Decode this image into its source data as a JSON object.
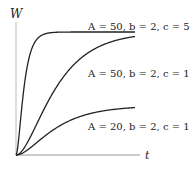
{
  "chart_data": {
    "type": "line",
    "title": "",
    "xlabel": "t",
    "ylabel": "W",
    "formula": "W = A(1 - e^{-ct})^b",
    "xlim": [
      0,
      4
    ],
    "ylim": [
      0,
      54
    ],
    "grid": false,
    "legend": "inline annotations",
    "series": [
      {
        "name": "A = 50, b = 2, c = 5",
        "A": 50,
        "b": 2,
        "c": 5,
        "x": [
          0,
          0.2,
          0.4,
          0.6,
          0.8,
          1.0,
          1.5,
          2,
          3,
          4
        ],
        "values": [
          0,
          20.0,
          37.4,
          45.5,
          48.2,
          49.3,
          50,
          50,
          50,
          50
        ]
      },
      {
        "name": "A = 50, b = 2, c = 1",
        "A": 50,
        "b": 2,
        "c": 1,
        "x": [
          0,
          0.5,
          1,
          1.5,
          2,
          2.5,
          3,
          3.5,
          4
        ],
        "values": [
          0,
          7.7,
          20.0,
          30.5,
          37.4,
          42.0,
          45.2,
          47.0,
          48.2
        ]
      },
      {
        "name": "A = 20, b = 2, c = 1",
        "A": 20,
        "b": 2,
        "c": 1,
        "x": [
          0,
          0.5,
          1,
          1.5,
          2,
          2.5,
          3,
          3.5,
          4
        ],
        "values": [
          0,
          3.1,
          8.0,
          12.2,
          15.0,
          16.8,
          18.1,
          18.8,
          19.3
        ]
      }
    ],
    "annotations": [
      {
        "text": "A = 50, b = 2, c = 5",
        "x": 88,
        "y": 30
      },
      {
        "text": "A = 50, b = 2, c = 1",
        "x": 88,
        "y": 77
      },
      {
        "text": "A = 20, b = 2, c = 1",
        "x": 88,
        "y": 130
      }
    ]
  },
  "labels": {
    "x_axis": "t",
    "y_axis": "W"
  }
}
